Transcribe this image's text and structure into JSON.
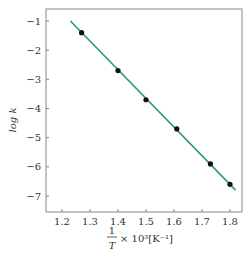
{
  "chart_data": {
    "type": "scatter",
    "title": "",
    "xlabel": "1/T × 10^3 [K^-1]",
    "ylabel": "log k",
    "xlim": [
      1.15,
      1.84
    ],
    "ylim": [
      -7.55,
      -0.6
    ],
    "grid": false,
    "x_ticks": [
      1.2,
      1.3,
      1.4,
      1.5,
      1.6,
      1.7,
      1.8
    ],
    "y_ticks": [
      -1,
      -2,
      -3,
      -4,
      -5,
      -6,
      -7
    ],
    "series": [
      {
        "name": "data points",
        "type": "scatter",
        "x": [
          1.27,
          1.4,
          1.5,
          1.61,
          1.73,
          1.8
        ],
        "y": [
          -1.4,
          -2.7,
          -3.7,
          -4.7,
          -5.9,
          -6.6
        ],
        "color": "#111111"
      },
      {
        "name": "fit line",
        "type": "line",
        "x": [
          1.23,
          1.82
        ],
        "y": [
          -1.0,
          -6.8
        ],
        "color": "#2e9a6e"
      }
    ]
  },
  "labels": {
    "ylabel_text": "log k",
    "xlabel_frac_num": "1",
    "xlabel_frac_den": "T",
    "xlabel_rest": "× 10³[K⁻¹]"
  }
}
